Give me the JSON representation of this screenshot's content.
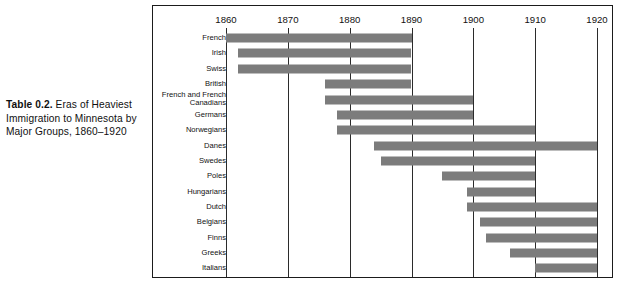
{
  "caption": {
    "lead": "Table 0.2.",
    "text": " Eras of Heaviest Immigration to Minnesota by Major Groups, 1860–1920"
  },
  "chart_data": {
    "type": "bar",
    "orientation": "horizontal-range",
    "title": "Table 0.2. Eras of Heaviest Immigration to Minnesota by Major Groups, 1860–1920",
    "xlabel": "",
    "ylabel": "",
    "xlim": [
      1858,
      1921
    ],
    "axis_ticks": [
      1860,
      1870,
      1880,
      1890,
      1900,
      1910,
      1920
    ],
    "grid": true,
    "legend": "none",
    "bar_color": "#7c7c7c",
    "categories": [
      "French",
      "Irish",
      "Swiss",
      "British",
      "French and French Canadians",
      "Germans",
      "Norwegians",
      "Danes",
      "Swedes",
      "Poles",
      "Hungarians",
      "Dutch",
      "Belgians",
      "Finns",
      "Greeks",
      "Italians"
    ],
    "ranges": [
      {
        "group": "French",
        "start": 1860,
        "end": 1890
      },
      {
        "group": "Irish",
        "start": 1862,
        "end": 1890
      },
      {
        "group": "Swiss",
        "start": 1862,
        "end": 1890
      },
      {
        "group": "British",
        "start": 1876,
        "end": 1890
      },
      {
        "group": "French and French Canadians",
        "start": 1876,
        "end": 1900
      },
      {
        "group": "Germans",
        "start": 1878,
        "end": 1900
      },
      {
        "group": "Norwegians",
        "start": 1878,
        "end": 1910
      },
      {
        "group": "Danes",
        "start": 1884,
        "end": 1920
      },
      {
        "group": "Swedes",
        "start": 1885,
        "end": 1910
      },
      {
        "group": "Poles",
        "start": 1895,
        "end": 1910
      },
      {
        "group": "Hungarians",
        "start": 1899,
        "end": 1910
      },
      {
        "group": "Dutch",
        "start": 1899,
        "end": 1920
      },
      {
        "group": "Belgians",
        "start": 1901,
        "end": 1920
      },
      {
        "group": "Finns",
        "start": 1902,
        "end": 1920
      },
      {
        "group": "Greeks",
        "start": 1906,
        "end": 1920
      },
      {
        "group": "Italians",
        "start": 1910,
        "end": 1920
      }
    ]
  }
}
